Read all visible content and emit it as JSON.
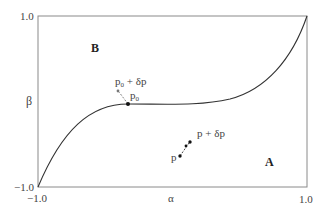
{
  "diagram": {
    "axes": {
      "x_label": "α",
      "y_label": "β",
      "x_min_label": "−1.0",
      "x_max_label": "1.0",
      "y_min_label": "−1.0",
      "y_max_label": "1.0"
    },
    "regions": {
      "upper": "B",
      "lower": "A"
    },
    "points": {
      "p0_label": "p",
      "p0_sub": "0",
      "p0_perturbed_label_prefix": "p",
      "p0_perturbed_sub": "0",
      "p0_perturbed_suffix": " + δp",
      "p_label": "p",
      "p_perturbed_label": "p + δp"
    },
    "colors": {
      "frame": "#888888",
      "curve": "#333333",
      "point": "#111111",
      "perturbed_point": "#777777"
    }
  }
}
